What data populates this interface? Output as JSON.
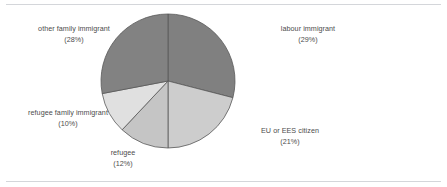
{
  "chart_data": {
    "type": "pie",
    "title": "",
    "subtitle": "",
    "xlabel": "",
    "ylabel": "",
    "legend_position": "none",
    "grid": false,
    "labels_outside": true,
    "start_angle_deg": 0,
    "direction": "clockwise",
    "categories": [
      "labour immigrant",
      "EU or EES citizen",
      "refugee",
      "refugee family immigrant",
      "other family immigrant"
    ],
    "values": [
      29,
      21,
      12,
      10,
      28
    ],
    "value_unit": "%",
    "slices": [
      {
        "label": "labour immigrant",
        "value": 29,
        "percent_text": "(29%)",
        "color": "#808080",
        "start_angle_deg": 0,
        "end_angle_deg": 104.4
      },
      {
        "label": "EU or EES citizen",
        "value": 21,
        "percent_text": "(21%)",
        "color": "#cdcdcd",
        "start_angle_deg": 104.4,
        "end_angle_deg": 180.0
      },
      {
        "label": "refugee",
        "value": 12,
        "percent_text": "(12%)",
        "color": "#c5c5c5",
        "start_angle_deg": 180.0,
        "end_angle_deg": 223.2
      },
      {
        "label": "refugee family immigrant",
        "value": 10,
        "percent_text": "(10%)",
        "color": "#e0e0e0",
        "start_angle_deg": 223.2,
        "end_angle_deg": 259.2
      },
      {
        "label": "other family immigrant",
        "value": 28,
        "percent_text": "(28%)",
        "color": "#828282",
        "start_angle_deg": 259.2,
        "end_angle_deg": 360.0
      }
    ]
  },
  "labels": {
    "other_family_immigrant": {
      "name": "other family immigrant",
      "percent": "(28%)"
    },
    "labour_immigrant": {
      "name": "labour immigrant",
      "percent": "(29%)"
    },
    "eu_ees_citizen": {
      "name": "EU or EES citizen",
      "percent": "(21%)"
    },
    "refugee": {
      "name": "refugee",
      "percent": "(12%)"
    },
    "refugee_family_immigrant": {
      "name": "refugee family immigrant",
      "percent": "(10%)"
    }
  },
  "style": {
    "background": "#ffffff",
    "rule_color": "#d4d6da",
    "text_color": "#4c4c4c",
    "slice_edge_color": "#595959"
  },
  "geometry": {
    "center_x": 168,
    "center_y": 81,
    "radius": 67
  }
}
